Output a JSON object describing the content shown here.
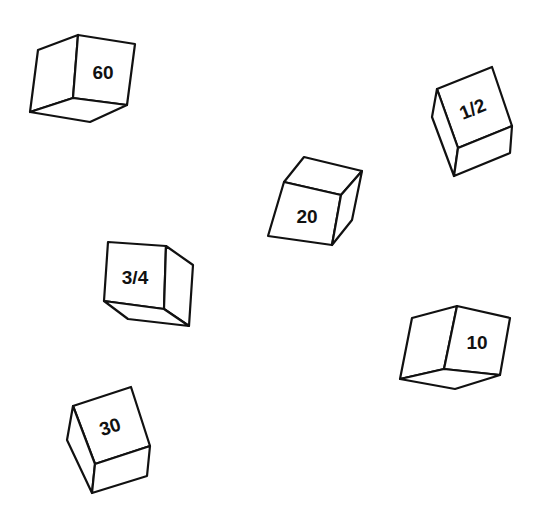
{
  "figure": {
    "background_color": "#ffffff",
    "line_color": "#111111"
  },
  "cubes": [
    {
      "label": "60",
      "position": "top-left"
    },
    {
      "label": "1/2",
      "position": "top-right"
    },
    {
      "label": "20",
      "position": "center"
    },
    {
      "label": "3/4",
      "position": "middle-left"
    },
    {
      "label": "10",
      "position": "middle-right"
    },
    {
      "label": "30",
      "position": "bottom-left"
    }
  ]
}
